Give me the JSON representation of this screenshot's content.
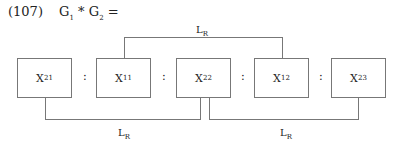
{
  "equation": {
    "number": "(107)",
    "lhs": {
      "g1": "G",
      "g1_sub": "1",
      "op": "*",
      "g2": "G",
      "g2_sub": "2",
      "eq": "="
    }
  },
  "boxes": [
    {
      "base": "X",
      "sub": "21"
    },
    {
      "base": "X",
      "sub": "11"
    },
    {
      "base": "X",
      "sub": "22"
    },
    {
      "base": "X",
      "sub": "12"
    },
    {
      "base": "X",
      "sub": "23"
    }
  ],
  "separator": ":",
  "links": {
    "top": {
      "base": "L",
      "sub": "R"
    },
    "bottom_left": {
      "base": "L",
      "sub": "R"
    },
    "bottom_right": {
      "base": "L",
      "sub": "R"
    }
  }
}
